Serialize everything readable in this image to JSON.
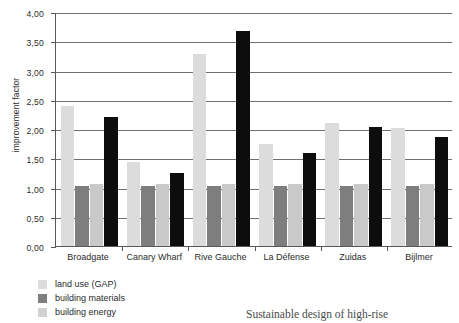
{
  "chart_data": {
    "type": "bar",
    "title": "",
    "xlabel": "",
    "ylabel": "improvement factor",
    "ylim": [
      0,
      4
    ],
    "ytick_step": 0.5,
    "grid": true,
    "legend_position": "bottom-left",
    "decimal_separator": ",",
    "categories": [
      "Broadgate",
      "Canary Wharf",
      "Rive Gauche",
      "La Défense",
      "Zuidas",
      "Bijlmer"
    ],
    "ytick_labels": [
      "0,00",
      "0,50",
      "1,00",
      "1,50",
      "2,00",
      "2,50",
      "3,00",
      "3,50",
      "4,00"
    ],
    "ytick_values": [
      0,
      0.5,
      1.0,
      1.5,
      2.0,
      2.5,
      3.0,
      3.5,
      4.0
    ],
    "series": [
      {
        "name": "land use (GAP)",
        "color": "#dcdcdc",
        "values": [
          2.4,
          1.43,
          3.28,
          1.74,
          2.11,
          2.02
        ]
      },
      {
        "name": "building materials",
        "color": "#7e7e7e",
        "values": [
          1.02,
          1.02,
          1.03,
          1.02,
          1.03,
          1.03
        ]
      },
      {
        "name": "building energy",
        "color": "#c9c9c9",
        "values": [
          1.06,
          1.06,
          1.06,
          1.06,
          1.06,
          1.06
        ]
      },
      {
        "name": "",
        "color": "#0d0d0d",
        "values": [
          2.21,
          1.25,
          3.68,
          1.59,
          2.03,
          1.87
        ]
      }
    ]
  },
  "legend": {
    "items": [
      {
        "label": "land use (GAP)",
        "swatch": "s0"
      },
      {
        "label": "building materials",
        "swatch": "s1"
      },
      {
        "label": "building energy",
        "swatch": "s2"
      }
    ]
  },
  "caption": {
    "text": "Sustainable design of high-rise"
  }
}
